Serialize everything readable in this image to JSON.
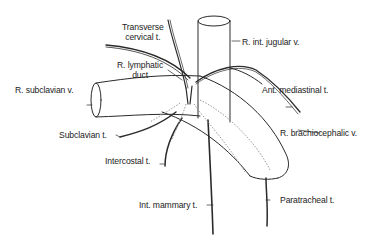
{
  "diagram": {
    "type": "anatomical-illustration",
    "labels": {
      "transverse_cervical": [
        "Transverse",
        "cervical t."
      ],
      "r_int_jugular": "R. int. jugular v.",
      "r_lymphatic_duct": [
        "R. lymphatic",
        "duct"
      ],
      "r_subclavian": "R. subclavian v.",
      "ant_mediastinal": "Ant. mediastinal t.",
      "subclavian_t": "Subclavian t.",
      "r_brachiocephalic": "R. brachiocephalic v.",
      "intercostal": "Intercostal t.",
      "int_mammary": "Int. mammary t.",
      "paratracheal": "Paratracheal t."
    },
    "colors": {
      "line": "#2a2a2a",
      "faint_line": "#9a9a9a",
      "background": "#ffffff"
    }
  }
}
